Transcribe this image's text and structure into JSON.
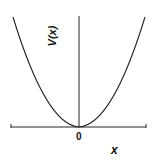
{
  "diagram": {
    "title": "",
    "y_axis_label": "V(x)",
    "x_axis_label": "x",
    "origin_label": "0",
    "curve": "parabola V(x) = kx^2, vertex at origin",
    "colors": {
      "stroke": "#222222",
      "background": "#ffffff"
    }
  }
}
